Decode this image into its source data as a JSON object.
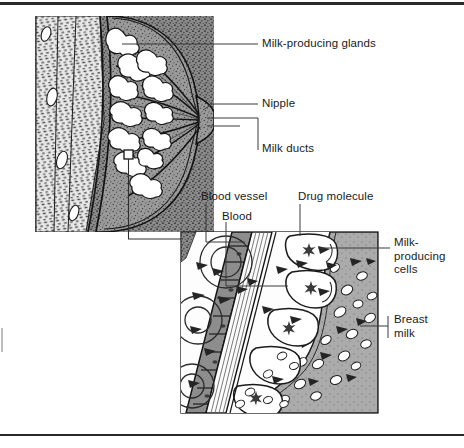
{
  "figure": {
    "type": "medical-diagram"
  },
  "labels": {
    "milk_producing_glands": "Milk-producing glands",
    "nipple": "Nipple",
    "milk_ducts": "Milk ducts",
    "blood_vessel": "Blood vessel",
    "blood": "Blood",
    "drug_molecule": "Drug molecule",
    "milk_producing_cells": "Milk-\nproducing\ncells",
    "breast_milk": "Breast\nmilk"
  },
  "panels": {
    "overview": {
      "name": "breast-cross-section",
      "parts": [
        "chest wall muscle",
        "fatty tissue",
        "milk-producing glands",
        "milk ducts",
        "nipple"
      ]
    },
    "detail": {
      "name": "magnified-tissue-detail",
      "parts": [
        "blood vessel",
        "blood",
        "drug molecule",
        "milk-producing cells",
        "breast milk",
        "fat cells"
      ]
    }
  },
  "colors": {
    "ink": "#1a1a1a",
    "tissue_fill": "#8f8f8f",
    "tissue_light": "#c9c9c9",
    "gland_white": "#ffffff",
    "vessel_fill": "#9a9a9a",
    "milk_fill": "#a8a8a8",
    "rule": "#2a2a2a"
  }
}
